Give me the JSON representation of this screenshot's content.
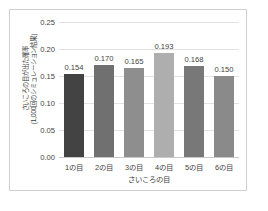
{
  "chart_data": {
    "type": "bar",
    "title": "",
    "categories": [
      "1の目",
      "2の目",
      "3の目",
      "4の目",
      "5の目",
      "6の目"
    ],
    "values": [
      0.154,
      0.17,
      0.165,
      0.193,
      0.168,
      0.15
    ],
    "value_labels": [
      "0.154",
      "0.170",
      "0.165",
      "0.193",
      "0.168",
      "0.150"
    ],
    "bar_colors": [
      "#434343",
      "#707070",
      "#8e8e8e",
      "#aeaeae",
      "#787878",
      "#8a8a8a"
    ],
    "xlabel": "さいころの目",
    "ylabel_line1": "さいころの目が出た確率",
    "ylabel_line2": "(1,000回のシミュレーション結果)",
    "ylim": [
      0,
      0.25
    ],
    "ytick_labels": [
      "0.00",
      "0.05",
      "0.10",
      "0.15",
      "0.20",
      "0.25"
    ],
    "ytick_values": [
      0,
      0.05,
      0.1,
      0.15,
      0.2,
      0.25
    ],
    "grid": true,
    "legend": false,
    "legend_position": "none",
    "border_color": "#cfcfcf",
    "gridline_color": "#e2e2e2",
    "text_color": "#3f3f3f",
    "background_color": "#ffffff"
  }
}
